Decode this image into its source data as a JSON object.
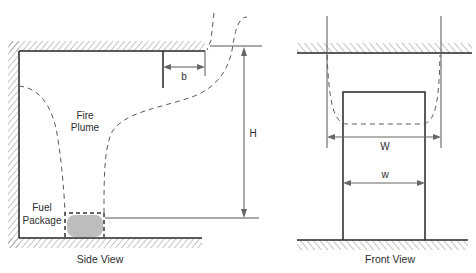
{
  "figure": {
    "colors": {
      "line": "#262626",
      "dimension": "#666666",
      "fuel_package_fill": "#bdbdbd",
      "background": "#ffffff"
    }
  },
  "side_view": {
    "caption": "Side View",
    "labels": {
      "plume_line1": "Fire",
      "plume_line2": "Plume",
      "fuel_line1": "Fuel",
      "fuel_line2": "Package"
    },
    "dimensions": {
      "b": "b",
      "H": "H"
    }
  },
  "front_view": {
    "caption": "Front View",
    "dimensions": {
      "W": "W",
      "w": "w"
    }
  }
}
